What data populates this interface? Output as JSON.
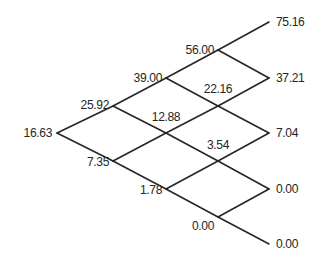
{
  "diagram": {
    "type": "recombining-binomial-lattice",
    "steps": 4,
    "line_color": "#262626",
    "text_color": "#262626",
    "background_color": "#ffffff",
    "nodes": [
      {
        "id": "n0_0",
        "value": "16.63",
        "step": 0,
        "level": 0,
        "x": 57,
        "y": 133,
        "label_x": 52,
        "label_y": 133,
        "anchor": "left"
      },
      {
        "id": "n1_0",
        "value": "25.92",
        "step": 1,
        "level": 0,
        "x": 113,
        "y": 106,
        "label_x": 109,
        "label_y": 105,
        "anchor": "left"
      },
      {
        "id": "n1_1",
        "value": "7.35",
        "step": 1,
        "level": 1,
        "x": 113,
        "y": 161,
        "label_x": 109,
        "label_y": 162,
        "anchor": "left"
      },
      {
        "id": "n2_0",
        "value": "39.00",
        "step": 2,
        "level": 0,
        "x": 166,
        "y": 78,
        "label_x": 162,
        "label_y": 78,
        "anchor": "left"
      },
      {
        "id": "n2_1",
        "value": "12.88",
        "step": 2,
        "level": 1,
        "x": 166,
        "y": 133,
        "label_x": 166,
        "label_y": 117,
        "anchor": "center"
      },
      {
        "id": "n2_2",
        "value": "1.78",
        "step": 2,
        "level": 2,
        "x": 166,
        "y": 189,
        "label_x": 162,
        "label_y": 190,
        "anchor": "left"
      },
      {
        "id": "n3_0",
        "value": "56.00",
        "step": 3,
        "level": 0,
        "x": 218,
        "y": 50,
        "label_x": 214,
        "label_y": 50,
        "anchor": "left"
      },
      {
        "id": "n3_1",
        "value": "22.16",
        "step": 3,
        "level": 1,
        "x": 218,
        "y": 106,
        "label_x": 218,
        "label_y": 89,
        "anchor": "center"
      },
      {
        "id": "n3_2",
        "value": "3.54",
        "step": 3,
        "level": 2,
        "x": 218,
        "y": 161,
        "label_x": 218,
        "label_y": 145,
        "anchor": "center"
      },
      {
        "id": "n3_3",
        "value": "0.00",
        "step": 3,
        "level": 3,
        "x": 218,
        "y": 217,
        "label_x": 214,
        "label_y": 226,
        "anchor": "left"
      },
      {
        "id": "n4_0",
        "value": "75.16",
        "step": 4,
        "level": 0,
        "x": 269,
        "y": 22,
        "label_x": 276,
        "label_y": 22,
        "anchor": "right"
      },
      {
        "id": "n4_1",
        "value": "37.21",
        "step": 4,
        "level": 1,
        "x": 269,
        "y": 78,
        "label_x": 276,
        "label_y": 78,
        "anchor": "right"
      },
      {
        "id": "n4_2",
        "value": "7.04",
        "step": 4,
        "level": 2,
        "x": 269,
        "y": 133,
        "label_x": 276,
        "label_y": 133,
        "anchor": "right"
      },
      {
        "id": "n4_3",
        "value": "0.00",
        "step": 4,
        "level": 3,
        "x": 269,
        "y": 189,
        "label_x": 276,
        "label_y": 189,
        "anchor": "right"
      },
      {
        "id": "n4_4",
        "value": "0.00",
        "step": 4,
        "level": 4,
        "x": 269,
        "y": 244,
        "label_x": 276,
        "label_y": 244,
        "anchor": "right"
      }
    ],
    "edges": [
      {
        "from": "n0_0",
        "to": "n1_0",
        "direction": "up"
      },
      {
        "from": "n0_0",
        "to": "n1_1",
        "direction": "down"
      },
      {
        "from": "n1_0",
        "to": "n2_0",
        "direction": "up"
      },
      {
        "from": "n1_0",
        "to": "n2_1",
        "direction": "down"
      },
      {
        "from": "n1_1",
        "to": "n2_1",
        "direction": "up"
      },
      {
        "from": "n1_1",
        "to": "n2_2",
        "direction": "down"
      },
      {
        "from": "n2_0",
        "to": "n3_0",
        "direction": "up"
      },
      {
        "from": "n2_0",
        "to": "n3_1",
        "direction": "down"
      },
      {
        "from": "n2_1",
        "to": "n3_1",
        "direction": "up"
      },
      {
        "from": "n2_1",
        "to": "n3_2",
        "direction": "down"
      },
      {
        "from": "n2_2",
        "to": "n3_2",
        "direction": "up"
      },
      {
        "from": "n2_2",
        "to": "n3_3",
        "direction": "down"
      },
      {
        "from": "n3_0",
        "to": "n4_0",
        "direction": "up"
      },
      {
        "from": "n3_0",
        "to": "n4_1",
        "direction": "down"
      },
      {
        "from": "n3_1",
        "to": "n4_1",
        "direction": "up"
      },
      {
        "from": "n3_1",
        "to": "n4_2",
        "direction": "down"
      },
      {
        "from": "n3_2",
        "to": "n4_2",
        "direction": "up"
      },
      {
        "from": "n3_2",
        "to": "n4_3",
        "direction": "down"
      },
      {
        "from": "n3_3",
        "to": "n4_3",
        "direction": "up"
      },
      {
        "from": "n3_3",
        "to": "n4_4",
        "direction": "down"
      }
    ]
  }
}
